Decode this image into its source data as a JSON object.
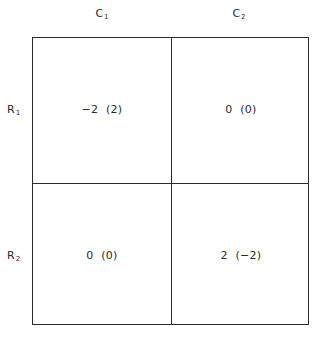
{
  "columns": [
    {
      "letter": "C",
      "sub": "1"
    },
    {
      "letter": "C",
      "sub": "2"
    }
  ],
  "rows": [
    {
      "letter": "R",
      "sub": "1"
    },
    {
      "letter": "R",
      "sub": "2"
    }
  ],
  "payoffs": {
    "r1c1": "−2  (2)",
    "r1c2": "0  (0)",
    "r2c1": "0  (0)",
    "r2c2": "2  (−2)"
  }
}
